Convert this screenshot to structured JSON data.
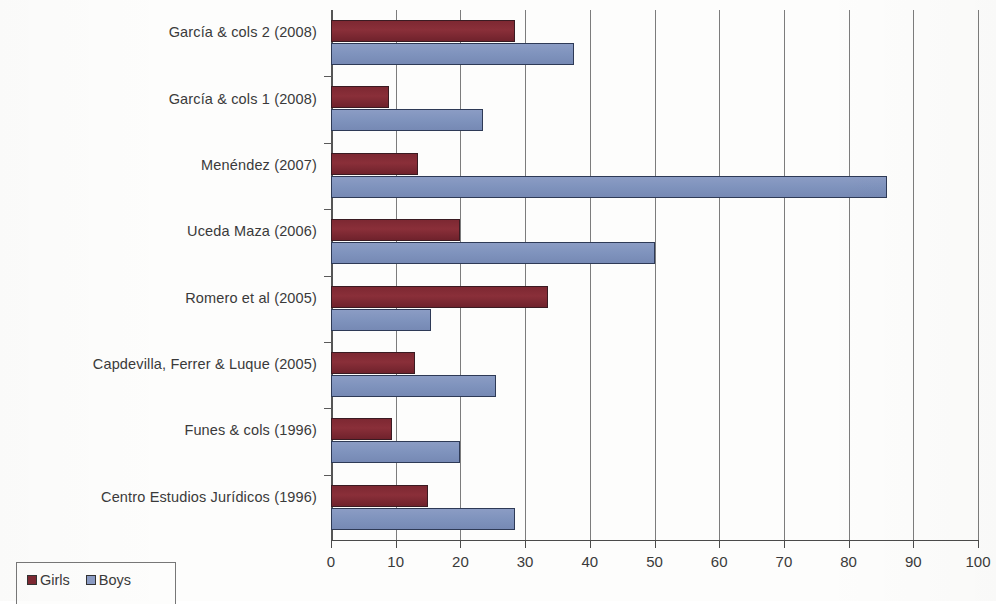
{
  "chart_data": {
    "type": "bar",
    "orientation": "horizontal",
    "title": "",
    "xlabel": "",
    "ylabel": "",
    "xlim": [
      0,
      100
    ],
    "xticks": [
      0,
      10,
      20,
      30,
      40,
      50,
      60,
      70,
      80,
      90,
      100
    ],
    "xtick_labels": [
      "0",
      "10",
      "20",
      "30",
      "40",
      "50",
      "60",
      "70",
      "80",
      "90",
      "100"
    ],
    "grid": true,
    "grid_axis": "x",
    "legend_position": "bottom-left",
    "categories": [
      "García & cols 2 (2008)",
      "García & cols 1 (2008)",
      "Menéndez (2007)",
      "Uceda Maza (2006)",
      "Romero et al (2005)",
      "Capdevilla, Ferrer & Luque (2005)",
      "Funes & cols (1996)",
      "Centro Estudios Jurídicos (1996)"
    ],
    "series": [
      {
        "name": "Girls",
        "color": "#7d2832",
        "values": [
          28.5,
          9,
          13.5,
          20,
          33.5,
          13,
          9.5,
          15
        ]
      },
      {
        "name": "Boys",
        "color": "#8b9cc4",
        "values": [
          37.5,
          23.5,
          86,
          50,
          15.5,
          25.5,
          20,
          28.5
        ]
      }
    ]
  },
  "legend": {
    "items": [
      {
        "label": "Girls",
        "color": "#7d2832"
      },
      {
        "label": "Boys",
        "color": "#8b9cc4"
      }
    ]
  }
}
